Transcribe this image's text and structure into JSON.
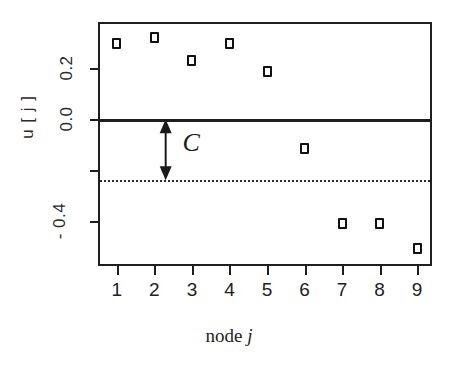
{
  "chart_data": {
    "type": "scatter",
    "title": "",
    "subtitle": "",
    "xlabel": "node j",
    "xlabel_plain": "node",
    "xlabel_italic": "j",
    "ylabel": "u [ j ]",
    "x": [
      1,
      2,
      3,
      4,
      5,
      6,
      7,
      8,
      9
    ],
    "categories": [
      "1",
      "2",
      "3",
      "4",
      "5",
      "6",
      "7",
      "8",
      "9"
    ],
    "values": [
      0.3,
      0.32,
      0.23,
      0.3,
      0.19,
      -0.115,
      -0.41,
      -0.41,
      -0.51
    ],
    "series": [
      {
        "name": "u[j]",
        "values": [
          0.3,
          0.32,
          0.23,
          0.3,
          0.19,
          -0.115,
          -0.41,
          -0.41,
          -0.51
        ]
      }
    ],
    "xlim": [
      0.55,
      9.45
    ],
    "ylim": [
      -0.585,
      0.375
    ],
    "xticks": [
      1,
      2,
      3,
      4,
      5,
      6,
      7,
      8,
      9
    ],
    "xtick_labels": [
      "1",
      "2",
      "3",
      "4",
      "5",
      "6",
      "7",
      "8",
      "9"
    ],
    "yticks": [
      0.2,
      0.0,
      -0.2,
      -0.4
    ],
    "ytick_labels": [
      "0.2",
      "0.0",
      "",
      "- 0.4"
    ],
    "grid": false,
    "legend": false,
    "legend_position": "none",
    "marker_style": "open-square",
    "marker_color": "#111111",
    "reference_lines": [
      {
        "name": "zero-line",
        "value": 0.0,
        "style": "solid",
        "color": "#1e1e1e"
      },
      {
        "name": "threshold-line",
        "value": -0.24,
        "style": "dotted",
        "color": "#2a2a2a"
      }
    ],
    "annotations": [
      {
        "name": "c-gap-annotation",
        "label": "C",
        "style": "double-headed-vertical-arrow",
        "x": 2.3,
        "y_from": 0.0,
        "y_to": -0.24,
        "label_x": 2.75,
        "label_y": -0.105
      }
    ]
  },
  "axes": {
    "frame_color": "#1e1e1e",
    "background": "#ffffff"
  }
}
